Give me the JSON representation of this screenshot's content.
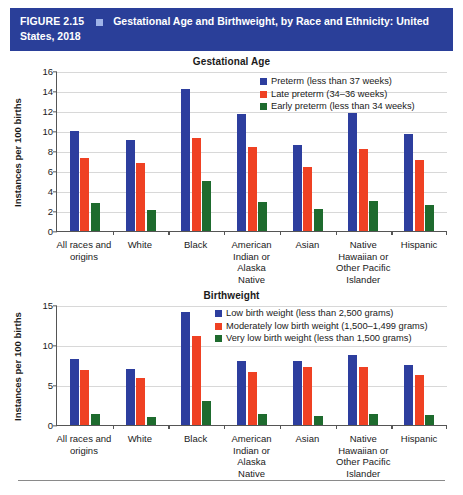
{
  "figure": {
    "number": "FIGURE 2.15",
    "title": "Gestational Age and Birthweight, by Race and Ethnicity: United States, 2018",
    "header_bg": "#2a3f99",
    "header_square": "#9fb3e8"
  },
  "colors": {
    "series_blue": "#2d3e9e",
    "series_orange": "#ef4123",
    "series_green": "#1e6b2e",
    "gridline": "#d8d8d8",
    "axis": "#555555"
  },
  "chart_data": [
    {
      "type": "bar",
      "title": "Gestational Age",
      "xlabel": "",
      "ylabel": "Instances per 100 births",
      "ylim": [
        0,
        16
      ],
      "yticks": [
        0,
        2,
        4,
        6,
        8,
        10,
        12,
        14,
        16
      ],
      "grid": true,
      "legend_position": "top-right",
      "categories": [
        "All races and origins",
        "White",
        "Black",
        "American Indian or Alaska Native",
        "Asian",
        "Native Hawaiian or Other Pacific Islander",
        "Hispanic"
      ],
      "series": [
        {
          "name": "Preterm (less than 37 weeks)",
          "color": "#2d3e9e",
          "values": [
            10.0,
            9.1,
            14.2,
            11.7,
            8.6,
            11.8,
            9.7
          ]
        },
        {
          "name": "Late preterm (34–36 weeks)",
          "color": "#ef4123",
          "values": [
            7.3,
            6.8,
            9.3,
            8.4,
            6.4,
            8.2,
            7.1
          ]
        },
        {
          "name": "Early preterm (less than 34 weeks)",
          "color": "#1e6b2e",
          "values": [
            2.8,
            2.1,
            5.0,
            2.9,
            2.2,
            3.0,
            2.6
          ]
        }
      ]
    },
    {
      "type": "bar",
      "title": "Birthweight",
      "xlabel": "",
      "ylabel": "Instances per 100 births",
      "ylim": [
        0,
        15
      ],
      "yticks": [
        0,
        5,
        10,
        15
      ],
      "grid": true,
      "legend_position": "top-right",
      "categories": [
        "All races and origins",
        "White",
        "Black",
        "American Indian or Alaska Native",
        "Asian",
        "Native Hawaiian or Other Pacific Islander",
        "Hispanic"
      ],
      "series": [
        {
          "name": "Low birth weight (less than 2,500 grams)",
          "color": "#2d3e9e",
          "values": [
            8.3,
            7.0,
            14.1,
            8.0,
            8.0,
            8.8,
            7.5
          ]
        },
        {
          "name": "Moderately low birth weight (1,500–1,499 grams)",
          "color": "#ef4123",
          "values": [
            6.9,
            5.9,
            11.1,
            6.6,
            7.3,
            7.3,
            6.2
          ]
        },
        {
          "name": "Very low birth weight (less than 1,500 grams)",
          "color": "#1e6b2e",
          "values": [
            1.4,
            1.0,
            3.0,
            1.4,
            1.1,
            1.4,
            1.2
          ]
        }
      ]
    }
  ]
}
